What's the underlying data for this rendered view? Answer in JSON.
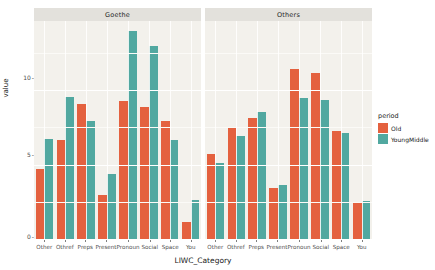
{
  "chart_data": {
    "type": "bar",
    "title": "",
    "xlabel": "LIWC_Category",
    "ylabel": "value",
    "categories": [
      "Other",
      "Othref",
      "Preps",
      "Present",
      "Pronoun",
      "Social",
      "Space",
      "You"
    ],
    "facet_variable": "corpus",
    "facets": [
      {
        "label": "Goethe",
        "series": [
          {
            "name": "Old",
            "values": [
              4.8,
              6.7,
              9.1,
              3.0,
              9.3,
              8.9,
              8.0,
              1.2
            ]
          },
          {
            "name": "YoungMiddle",
            "values": [
              6.8,
              9.6,
              8.0,
              4.4,
              14.0,
              13.0,
              6.7,
              2.7
            ]
          }
        ]
      },
      {
        "label": "Others",
        "series": [
          {
            "name": "Old",
            "values": [
              5.8,
              7.6,
              8.2,
              3.5,
              11.5,
              11.2,
              7.3,
              2.5
            ]
          },
          {
            "name": "YoungMiddle",
            "values": [
              5.2,
              7.0,
              8.6,
              3.7,
              9.5,
              9.4,
              7.2,
              2.6
            ]
          }
        ]
      }
    ],
    "ylim": [
      0,
      14.7
    ],
    "yticks": [
      0,
      5,
      10
    ],
    "yticklabels": [
      "0",
      "5",
      "10"
    ],
    "grid": true,
    "legend": {
      "title": "period",
      "position": "right",
      "entries": [
        {
          "label": "Old",
          "color": "#E4613F"
        },
        {
          "label": "YoungMiddle",
          "color": "#51A8A0"
        }
      ]
    },
    "colors": {
      "old": "#E4613F",
      "youngmiddle": "#51A8A0",
      "panel_background": "#f3f1ec",
      "strip_background": "#e3e1dc",
      "gridline": "#ffffff"
    }
  }
}
